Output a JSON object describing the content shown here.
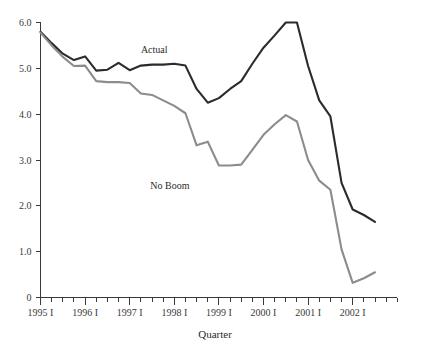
{
  "chart_data": {
    "type": "line",
    "title": "",
    "xlabel": "Quarter",
    "ylabel": "",
    "ylim": [
      0,
      6.0
    ],
    "grid": false,
    "legend_position": "inline-annotations",
    "y_ticks": [
      "0",
      "1.0",
      "2.0",
      "3.0",
      "4.0",
      "5.0",
      "6.0"
    ],
    "y_tick_values": [
      0,
      1.0,
      2.0,
      3.0,
      4.0,
      5.0,
      6.0
    ],
    "x_tick_labels": [
      "1995 I",
      "1996 I",
      "1997 I",
      "1998 I",
      "1999 I",
      "2000 I",
      "2001 I",
      "2002 I"
    ],
    "x_tick_label_indices": [
      0,
      4,
      8,
      12,
      16,
      20,
      24,
      28
    ],
    "x_minor_tick_count": 32,
    "x": [
      "1995 I",
      "1995 II",
      "1995 III",
      "1995 IV",
      "1996 I",
      "1996 II",
      "1996 III",
      "1996 IV",
      "1997 I",
      "1997 II",
      "1997 III",
      "1997 IV",
      "1998 I",
      "1998 II",
      "1998 III",
      "1998 IV",
      "1999 I",
      "1999 II",
      "1999 III",
      "1999 IV",
      "2000 I",
      "2000 II",
      "2000 III",
      "2000 IV",
      "2001 I",
      "2001 II",
      "2001 III",
      "2001 IV",
      "2002 I",
      "2002 II",
      "2002 III"
    ],
    "series": [
      {
        "name": "Actual",
        "color": "#2b2b2b",
        "label_x_index": 10.2,
        "label_y_value": 5.42,
        "values": [
          5.8,
          5.55,
          5.32,
          5.18,
          5.26,
          4.95,
          4.97,
          5.12,
          4.96,
          5.06,
          5.08,
          5.08,
          5.1,
          5.06,
          4.55,
          4.25,
          4.35,
          4.55,
          4.72,
          5.1,
          5.45,
          5.72,
          6.0,
          6.0,
          5.05,
          4.3,
          3.95,
          2.5,
          1.92,
          1.8,
          1.65
        ]
      },
      {
        "name": "No Boom",
        "color": "#8c8c8c",
        "label_x_index": 11.6,
        "label_y_value": 2.45,
        "values": [
          5.78,
          5.5,
          5.25,
          5.05,
          5.06,
          4.72,
          4.7,
          4.7,
          4.68,
          4.45,
          4.42,
          4.3,
          4.18,
          4.02,
          3.32,
          3.4,
          2.88,
          2.88,
          2.9,
          3.22,
          3.55,
          3.78,
          3.98,
          3.84,
          3.0,
          2.55,
          2.35,
          1.05,
          0.32,
          0.42,
          0.55
        ]
      }
    ],
    "colors": {
      "actual": "#2b2b2b",
      "no_boom": "#8c8c8c",
      "axis": "#3a3a3a",
      "background": "#ffffff"
    }
  }
}
